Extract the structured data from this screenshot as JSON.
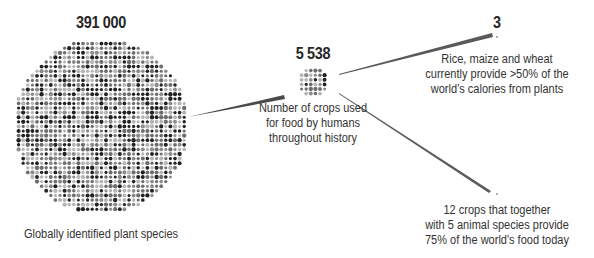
{
  "nodes": [
    {
      "id": "plant_species",
      "value": "391 000",
      "label": "Globally identified plant species",
      "circle": {
        "cx": 101,
        "cy": 126,
        "r": 87,
        "dot_spacing": 4.6
      }
    },
    {
      "id": "crops_history",
      "value": "5 538",
      "label_lines": [
        "Number of crops used",
        "for food by humans",
        "throughout history"
      ],
      "circle": {
        "cx": 313,
        "cy": 82,
        "r": 16,
        "dot_spacing": 4.6
      }
    },
    {
      "id": "top3",
      "value": "3",
      "label_lines": [
        "Rice, maize and wheat",
        "currently provide >50% of the",
        "world’s calories from plants"
      ],
      "circle": {
        "cx": 497,
        "cy": 35,
        "r": 1
      }
    },
    {
      "id": "top12",
      "value": "12",
      "label_lines": [
        "12 crops that together",
        "with 5 animal species provide",
        "75% of the world's food today"
      ],
      "circle": {
        "cx": 497,
        "cy": 193,
        "r": 1
      }
    }
  ],
  "colors": {
    "dot_dark": "#222222",
    "dot_mid": "#6e6e6e",
    "dot_light": "#b5b5b5",
    "line": "#555555",
    "text": "#2a2a2a"
  }
}
